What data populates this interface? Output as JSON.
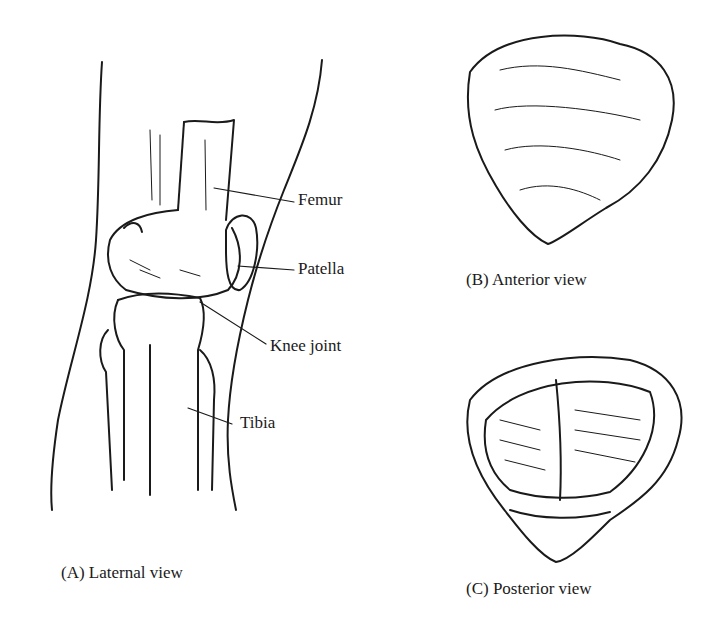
{
  "figure": {
    "panels": [
      {
        "id": "A",
        "caption": "(A) Laternal view"
      },
      {
        "id": "B",
        "caption": "(B) Anterior view"
      },
      {
        "id": "C",
        "caption": "(C) Posterior view"
      }
    ],
    "labels": {
      "femur": "Femur",
      "patella": "Patella",
      "knee_joint": "Knee joint",
      "tibia": "Tibia"
    },
    "colors": {
      "ink": "#1a1a1a",
      "background": "#ffffff"
    }
  }
}
